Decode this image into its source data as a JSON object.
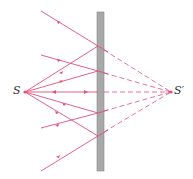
{
  "diagram": {
    "labels": {
      "source": "S",
      "image": "S′"
    },
    "colors": {
      "ray": "#e0507a",
      "mirror": "#a0a0a0",
      "mirror_edge": "#808080",
      "text": "#333333"
    },
    "mirror": {
      "x": 97,
      "width": 7,
      "y_top": 12,
      "y_bottom": 171
    },
    "source_point": {
      "x": 25,
      "y": 92
    },
    "image_point": {
      "x": 171,
      "y": 92
    },
    "reflection_points_y": [
      46,
      71,
      92,
      113,
      136
    ]
  }
}
